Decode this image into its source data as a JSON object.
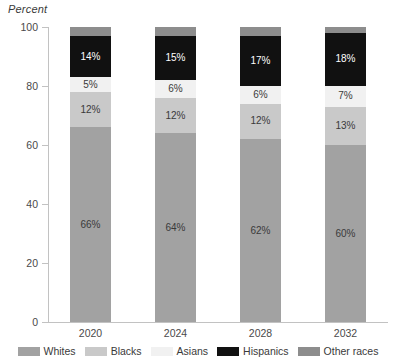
{
  "chart_data": {
    "type": "bar",
    "stacked": true,
    "title": "",
    "subtitle": "",
    "ylabel": "Percent",
    "xlabel": "",
    "ylim": [
      0,
      100
    ],
    "yticks": [
      0,
      20,
      40,
      60,
      80,
      100
    ],
    "grid": false,
    "legend_position": "bottom",
    "categories": [
      "2020",
      "2024",
      "2028",
      "2032"
    ],
    "series": [
      {
        "name": "Whites",
        "color": "#a2a2a2",
        "values": [
          66,
          64,
          62,
          60
        ],
        "labels": [
          "66%",
          "64%",
          "62%",
          "60%"
        ]
      },
      {
        "name": "Blacks",
        "color": "#c9c9c9",
        "values": [
          12,
          12,
          12,
          13
        ],
        "labels": [
          "12%",
          "12%",
          "12%",
          "13%"
        ]
      },
      {
        "name": "Asians",
        "color": "#f1f1f1",
        "values": [
          5,
          6,
          6,
          7
        ],
        "labels": [
          "5%",
          "6%",
          "6%",
          "7%"
        ]
      },
      {
        "name": "Hispanics",
        "color": "#111111",
        "values": [
          14,
          15,
          17,
          18
        ],
        "labels": [
          "14%",
          "15%",
          "17%",
          "18%"
        ]
      },
      {
        "name": "Other races",
        "color": "#8d8d8d",
        "values": [
          3,
          3,
          3,
          2
        ],
        "labels": [
          "",
          "",
          "",
          ""
        ]
      }
    ]
  },
  "axis": {
    "y_title": "Percent",
    "y_tick_labels": [
      "0",
      "20",
      "40",
      "60",
      "80",
      "100"
    ],
    "x_tick_labels": [
      "2020",
      "2024",
      "2028",
      "2032"
    ]
  },
  "legend": {
    "items": [
      {
        "label": "Whites",
        "color": "#a2a2a2"
      },
      {
        "label": "Blacks",
        "color": "#c9c9c9"
      },
      {
        "label": "Asians",
        "color": "#f1f1f1"
      },
      {
        "label": "Hispanics",
        "color": "#111111"
      },
      {
        "label": "Other races",
        "color": "#8d8d8d"
      }
    ]
  },
  "colors": {
    "axis": "#c2c2c2",
    "text": "#3a3a3a",
    "background": "#ffffff"
  }
}
